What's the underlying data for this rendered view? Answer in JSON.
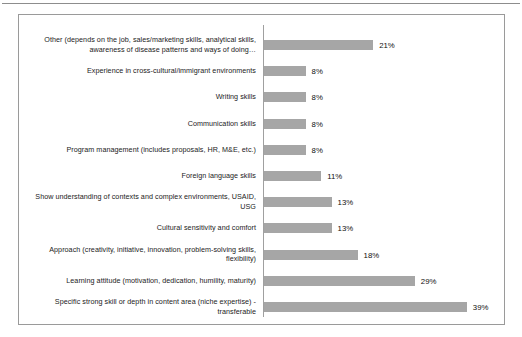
{
  "chart_data": {
    "type": "bar",
    "orientation": "horizontal",
    "title": "",
    "subtitle": "",
    "xlabel": "",
    "ylabel": "",
    "grid": false,
    "legend": null,
    "xlim": [
      0,
      39
    ],
    "value_suffix": "%",
    "categories": [
      "Other (depends on the job, sales/marketing skills, analytical skills, awareness of disease patterns and ways of doing…",
      "Experience in cross-cultural/immigrant environments",
      "Writing skills",
      "Communication skills",
      "Program management (includes proposals, HR, M&E, etc.)",
      "Foreign language skills",
      "Show understanding of contexts and complex environments, USAID, USG",
      "Cultural sensitivity and comfort",
      "Approach (creativity, initiative, innovation, problem-solving skills, flexibility)",
      "Learning attitude (motivation, dedication, humility, maturity)",
      "Specific strong skill or depth in content area (niche expertise) - transferable"
    ],
    "values": [
      21,
      8,
      8,
      8,
      8,
      11,
      13,
      13,
      18,
      29,
      39
    ],
    "value_labels": [
      "21%",
      "8%",
      "8%",
      "8%",
      "8%",
      "11%",
      "13%",
      "13%",
      "18%",
      "29%",
      "39%"
    ],
    "colors": {
      "bar_fill": "#a6a6a6",
      "axis_line": "#a0a0a0",
      "frame_border": "#9a9a9a",
      "label_text": "#1b1b1b",
      "value_text": "#0f0f0f",
      "background": "#ffffff",
      "top_rule": "#8d8d8d"
    }
  }
}
